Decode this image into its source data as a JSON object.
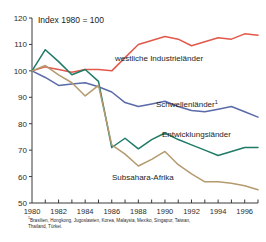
{
  "subtitle": "Index 1980 = 100",
  "footnote_marker": "1",
  "footnote_text": "Brasilien, Hongkong, Jugoslawien, Korea, Malaysia, Mexiko, Singapur, Taiwan, Thailand, Türkei.",
  "axis": {
    "y_ticks": [
      "120",
      "110",
      "100",
      "90",
      "80",
      "70",
      "60",
      "50"
    ],
    "x_ticks_labeled": [
      "1980",
      "1982",
      "1984",
      "1986",
      "1988",
      "1990",
      "1992",
      "1994",
      "1996"
    ]
  },
  "labels": {
    "industrie": "westliche Industrieländer",
    "schwellen": "Schwellenländer",
    "schwellen_sup": "1",
    "entwicklung": "Entwicklungsländer",
    "subsahara": "Subsahara-Afrika"
  },
  "colors": {
    "industrie": "#e2584a",
    "schwellen": "#5b6aa8",
    "entwicklung": "#1f7a68",
    "subsahara": "#b49a6e",
    "axis": "#3a3a3a",
    "text": "#1d1d1d"
  },
  "chart_data": {
    "type": "line",
    "title": "",
    "subtitle": "Index 1980 = 100",
    "xlabel": "",
    "ylabel": "Index 1980 = 100",
    "xlim": [
      1980,
      1997
    ],
    "ylim": [
      50,
      120
    ],
    "grid": false,
    "legend": "inline-annotations",
    "x": [
      1980,
      1981,
      1982,
      1983,
      1984,
      1985,
      1986,
      1987,
      1988,
      1989,
      1990,
      1991,
      1992,
      1993,
      1994,
      1995,
      1996,
      1997
    ],
    "series": [
      {
        "name": "westliche Industrieländer",
        "color": "#e2584a",
        "values": [
          100,
          101.5,
          100.5,
          99.5,
          100.5,
          100.5,
          100,
          105,
          110,
          111.5,
          113,
          112,
          109.5,
          111,
          112.5,
          112,
          114,
          113.5
        ]
      },
      {
        "name": "Schwellenländer",
        "color": "#5b6aa8",
        "values": [
          100,
          97.5,
          94.5,
          95,
          95.5,
          94,
          92,
          88,
          86.5,
          87.5,
          88.5,
          86.5,
          85,
          84.5,
          85.5,
          86.5,
          84.5,
          82.5
        ]
      },
      {
        "name": "Entwicklungsländer",
        "color": "#1f7a68",
        "values": [
          100,
          108,
          103.5,
          98.5,
          100.5,
          96,
          71,
          74.5,
          70.5,
          74,
          76.5,
          74,
          72,
          70,
          68,
          69.5,
          71,
          71
        ]
      },
      {
        "name": "Subsahara-Afrika",
        "color": "#b49a6e",
        "values": [
          100,
          102,
          98.5,
          95.5,
          90.5,
          94.5,
          72,
          68.5,
          64,
          66.5,
          69.5,
          64.5,
          61,
          58,
          58,
          57.5,
          56.5,
          55
        ]
      }
    ]
  }
}
